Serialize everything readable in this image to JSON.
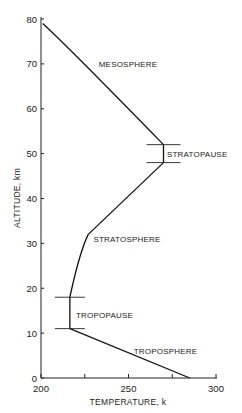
{
  "chart_data": {
    "type": "line",
    "title": "",
    "xlabel": "TEMPERATURE, k",
    "ylabel": "ALTITUDE, km",
    "xlim": [
      200,
      300
    ],
    "ylim": [
      0,
      80
    ],
    "x_ticks": [
      200,
      225,
      250,
      275,
      300
    ],
    "x_tick_labels": [
      "200",
      "",
      "250",
      "",
      "300"
    ],
    "y_ticks": [
      0,
      10,
      20,
      30,
      40,
      50,
      60,
      70,
      80
    ],
    "y_tick_labels": [
      "0",
      "10",
      "20",
      "30",
      "40",
      "50",
      "60",
      "70",
      "80"
    ],
    "grid": false,
    "legend": null,
    "series": [
      {
        "name": "Temperature profile",
        "points": [
          {
            "temperature": 285,
            "altitude": 0
          },
          {
            "temperature": 216.5,
            "altitude": 11
          },
          {
            "temperature": 216.5,
            "altitude": 18
          },
          {
            "temperature": 222,
            "altitude": 28
          },
          {
            "temperature": 227,
            "altitude": 32
          },
          {
            "temperature": 270,
            "altitude": 48
          },
          {
            "temperature": 270,
            "altitude": 52
          },
          {
            "temperature": 240,
            "altitude": 64
          },
          {
            "temperature": 215,
            "altitude": 74
          },
          {
            "temperature": 201,
            "altitude": 79
          }
        ]
      }
    ],
    "boundaries": [
      {
        "name": "TROPOPAUSE",
        "altitude_low": 11,
        "altitude_high": 18,
        "temperature": 216.5
      },
      {
        "name": "STRATOPAUSE",
        "altitude_low": 48,
        "altitude_high": 52,
        "temperature": 270
      }
    ],
    "annotations": [
      {
        "text": "MESOSPHERE",
        "temperature": 233,
        "altitude": 70
      },
      {
        "text": "STRATOPAUSE",
        "temperature": 272,
        "altitude": 50
      },
      {
        "text": "STRATOSPHERE",
        "temperature": 230,
        "altitude": 31
      },
      {
        "text": "TROPOPAUSE",
        "temperature": 220,
        "altitude": 14
      },
      {
        "text": "TROPOSPHERE",
        "temperature": 253,
        "altitude": 6
      }
    ]
  }
}
